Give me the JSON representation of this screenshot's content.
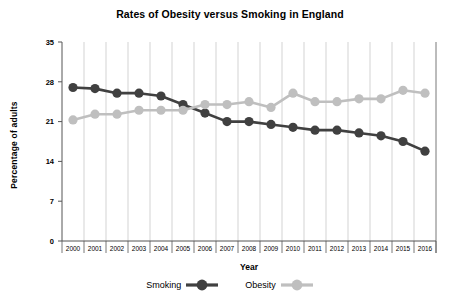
{
  "chart_data": {
    "type": "line",
    "title": "Rates of Obesity versus Smoking in England",
    "xlabel": "Year",
    "ylabel": "Percentage of adults",
    "categories": [
      "2000",
      "2001",
      "2002",
      "2003",
      "2004",
      "2005",
      "2006",
      "2007",
      "2008",
      "2009",
      "2010",
      "2011",
      "2012",
      "2013",
      "2014",
      "2015",
      "2016"
    ],
    "ylim": [
      0,
      35
    ],
    "yticks": [
      0,
      7,
      14,
      21,
      28,
      35
    ],
    "ytick_labels": [
      "0",
      "7",
      "14",
      "21",
      "28",
      "35"
    ],
    "grid": true,
    "grid_axis": "x",
    "legend_position": "bottom",
    "series": [
      {
        "name": "Smoking",
        "color": "#404040",
        "values": [
          27.0,
          26.8,
          26.0,
          26.0,
          25.5,
          24.0,
          22.5,
          21.0,
          21.0,
          20.5,
          20.0,
          19.5,
          19.5,
          19.0,
          18.5,
          17.5,
          15.8
        ]
      },
      {
        "name": "Obesity",
        "color": "#bfbfbf",
        "values": [
          21.3,
          22.3,
          22.3,
          23.0,
          23.0,
          23.0,
          24.0,
          24.0,
          24.5,
          23.5,
          26.0,
          24.5,
          24.5,
          25.0,
          25.0,
          26.5,
          26.0
        ]
      }
    ]
  },
  "legend": {
    "entries": [
      {
        "label": "Smoking",
        "color": "#404040"
      },
      {
        "label": "Obesity",
        "color": "#bfbfbf"
      }
    ]
  },
  "colors": {
    "smoking": "#404040",
    "obesity": "#bfbfbf",
    "axis": "#555555",
    "grid": "#c8c8c8",
    "text": "#000000",
    "background": "#ffffff"
  }
}
